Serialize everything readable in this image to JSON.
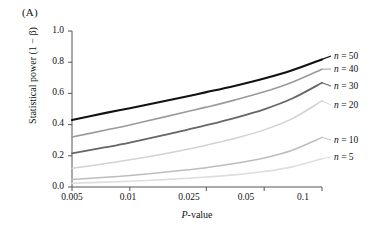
{
  "panel": {
    "label": "(A)"
  },
  "axes": {
    "ylabel": "Statistical power (1 − β)",
    "xlabel_italic": "P",
    "xlabel_rest": "-value",
    "xlabel_full": "P-value",
    "y_ticks": [
      "0.0",
      "0.2",
      "0.4",
      "0.6",
      "0.8",
      "1.0"
    ],
    "x_ticks": [
      "0.005",
      "0.01",
      "0.025",
      "0.05",
      "0.1"
    ]
  },
  "legend": {
    "items": [
      {
        "label_var": "n",
        "label_eq": "= 50",
        "label": "n = 50",
        "color": "#111111"
      },
      {
        "label_var": "n",
        "label_eq": "= 40",
        "label": "n = 40",
        "color": "#9a9a9a"
      },
      {
        "label_var": "n",
        "label_eq": "= 30",
        "label": "n = 30",
        "color": "#666666"
      },
      {
        "label_var": "n",
        "label_eq": "= 20",
        "label": "n = 20",
        "color": "#d2d2d2"
      },
      {
        "label_var": "n",
        "label_eq": "= 10",
        "label": "n = 10",
        "color": "#bdbdbd"
      },
      {
        "label_var": "n",
        "label_eq": "= 5",
        "label": "n = 5",
        "color": "#dedede"
      }
    ]
  },
  "chart_data": {
    "type": "line",
    "title": "(A)",
    "xlabel": "P-value",
    "ylabel": "Statistical power (1 − β)",
    "x_scale": "log",
    "xlim": [
      0.005,
      0.1
    ],
    "ylim": [
      0.0,
      1.0
    ],
    "grid": false,
    "legend_position": "right-outside",
    "x_tick_values": [
      0.005,
      0.01,
      0.025,
      0.05,
      0.1
    ],
    "x_tick_labels": [
      "0.005",
      "0.01",
      "0.025",
      "0.05",
      "0.1"
    ],
    "y_tick_values": [
      0.0,
      0.2,
      0.4,
      0.6,
      0.8,
      1.0
    ],
    "y_tick_labels": [
      "0.0",
      "0.2",
      "0.4",
      "0.6",
      "0.8",
      "1.0"
    ],
    "x": [
      0.005,
      0.0075,
      0.01,
      0.015,
      0.02,
      0.025,
      0.035,
      0.05,
      0.07,
      0.1
    ],
    "series": [
      {
        "name": "n = 50",
        "color": "#111111",
        "width": 2.1,
        "values": [
          0.43,
          0.475,
          0.505,
          0.55,
          0.582,
          0.608,
          0.648,
          0.695,
          0.748,
          0.818
        ]
      },
      {
        "name": "n = 40",
        "color": "#9a9a9a",
        "width": 1.6,
        "values": [
          0.32,
          0.365,
          0.398,
          0.448,
          0.484,
          0.512,
          0.557,
          0.61,
          0.672,
          0.755
        ]
      },
      {
        "name": "n = 30",
        "color": "#666666",
        "width": 1.8,
        "values": [
          0.215,
          0.255,
          0.285,
          0.332,
          0.368,
          0.396,
          0.442,
          0.498,
          0.567,
          0.668
        ]
      },
      {
        "name": "n = 20",
        "color": "#d2d2d2",
        "width": 1.5,
        "values": [
          0.12,
          0.15,
          0.174,
          0.212,
          0.242,
          0.268,
          0.311,
          0.366,
          0.438,
          0.552
        ]
      },
      {
        "name": "n = 10",
        "color": "#bdbdbd",
        "width": 1.5,
        "values": [
          0.048,
          0.062,
          0.074,
          0.094,
          0.11,
          0.124,
          0.15,
          0.186,
          0.236,
          0.318
        ]
      },
      {
        "name": "n = 5",
        "color": "#dedede",
        "width": 1.6,
        "values": [
          0.024,
          0.031,
          0.037,
          0.047,
          0.056,
          0.064,
          0.078,
          0.099,
          0.129,
          0.181
        ]
      }
    ]
  }
}
